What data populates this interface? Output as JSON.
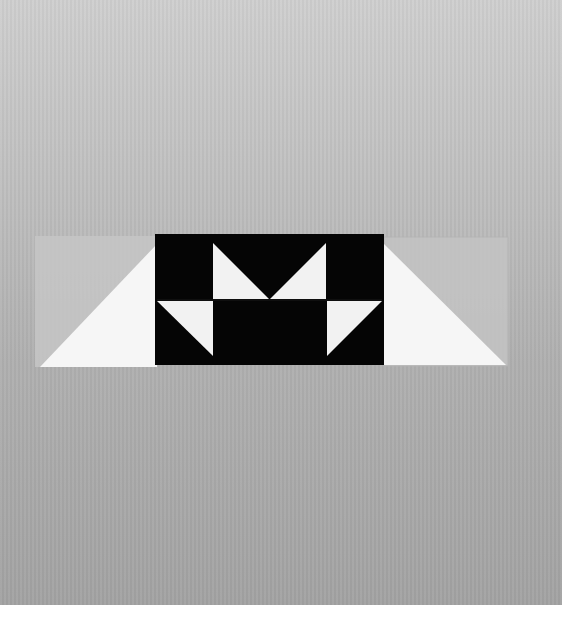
{
  "image": {
    "subject": "Quilt block unit on gray background",
    "description": "Black and white flying-geese style quilt block with white triangle flanks on translucent strips",
    "colors": {
      "background_top": "#cfcfcf",
      "background_bottom": "#a3a3a3",
      "block_dark": "#050505",
      "block_light": "#f4f4f4",
      "strip": "#c4c4c4",
      "margin": "#ffffff"
    }
  }
}
